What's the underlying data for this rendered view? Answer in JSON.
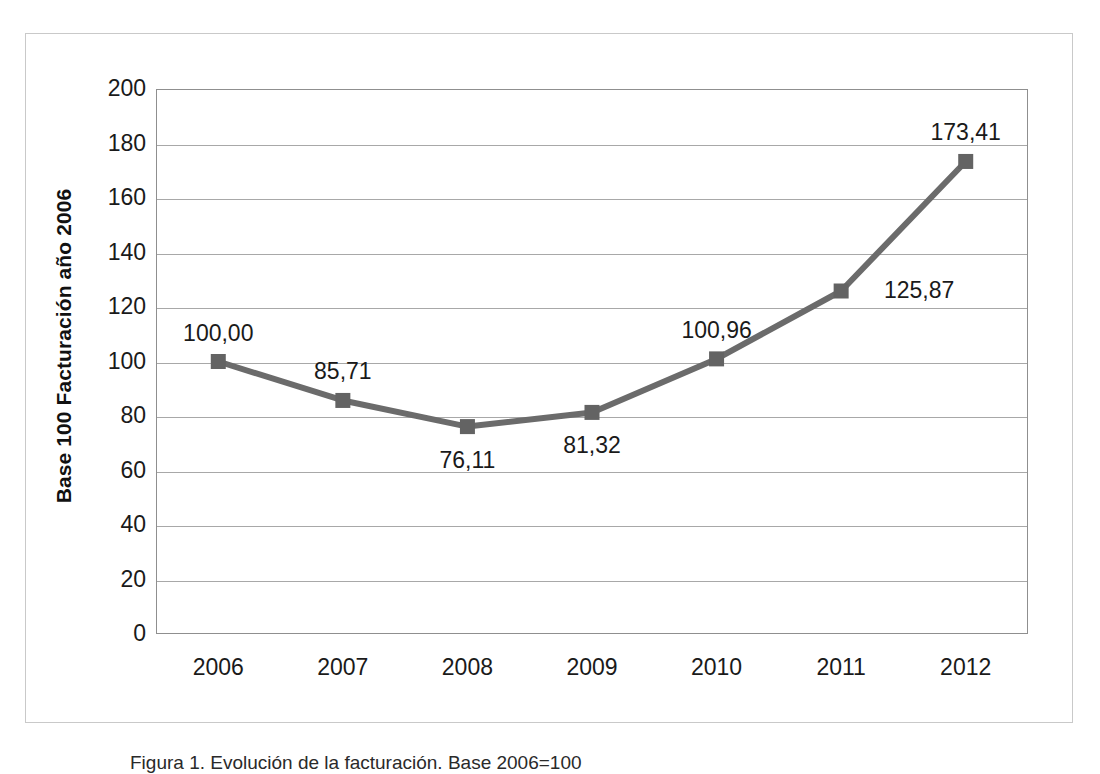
{
  "figure": {
    "caption": "Figura 1. Evolución de la facturación. Base 2006=100",
    "y_axis_title": "Base 100 Facturación  año 2006"
  },
  "colors": {
    "series": "#6b6b6b",
    "marker": "#636363",
    "gridline": "#a8a8a8",
    "plot_border": "#8f8f8f",
    "page_border": "#c9c9c9",
    "text": "#1a1a1a"
  },
  "chart_data": {
    "type": "line",
    "title": "",
    "xlabel": "",
    "ylabel": "Base 100 Facturación  año 2006",
    "categories": [
      "2006",
      "2007",
      "2008",
      "2009",
      "2010",
      "2011",
      "2012"
    ],
    "values": [
      100.0,
      85.71,
      76.11,
      81.32,
      100.96,
      125.87,
      173.41
    ],
    "point_labels": [
      "100,00",
      "85,71",
      "76,11",
      "81,32",
      "100,96",
      "125,87",
      "173,41"
    ],
    "label_positions": [
      "above",
      "above",
      "below",
      "below",
      "above",
      "right",
      "above"
    ],
    "ylim": [
      0,
      200
    ],
    "yticks": [
      0,
      20,
      40,
      60,
      80,
      100,
      120,
      140,
      160,
      180,
      200
    ],
    "ytick_labels": [
      "0",
      "20",
      "40",
      "60",
      "80",
      "100",
      "120",
      "140",
      "160",
      "180",
      "200"
    ],
    "grid": true,
    "legend": false,
    "marker": "square",
    "decimal_separator": ","
  }
}
